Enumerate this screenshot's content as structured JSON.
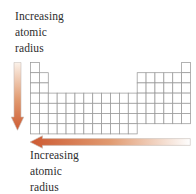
{
  "figure": {
    "background": "#ffffff",
    "labels": {
      "top": {
        "lines": [
          "Increasing",
          "atomic",
          "radius"
        ]
      },
      "bottom": {
        "lines": [
          "Increasing",
          "atomic",
          "radius"
        ]
      }
    },
    "colors": {
      "text": "#2d2d2d",
      "grid_line": "#999999",
      "cell_fill": "#ffffff",
      "arrow_dark": "#cd5a32",
      "arrow_mid": "#e19a70",
      "arrow_light_warm": "#fbf2ea",
      "arrow_light_end": "#fefefe",
      "arrow_outline": "#c6beb8"
    },
    "arrows": [
      {
        "name": "vertical-arrow",
        "direction": "down",
        "meaning": "atomic radius increases down a group"
      },
      {
        "name": "horizontal-arrow",
        "direction": "left",
        "meaning": "atomic radius increases right-to-left across a period"
      }
    ],
    "periodic_table": {
      "columns": 18,
      "rows": [
        {
          "row": 1,
          "segments": [
            {
              "start_col": 1,
              "span": 1
            },
            {
              "start_col": 18,
              "span": 1
            }
          ]
        },
        {
          "row": 2,
          "segments": [
            {
              "start_col": 1,
              "span": 2
            },
            {
              "start_col": 13,
              "span": 6
            }
          ]
        },
        {
          "row": 3,
          "segments": [
            {
              "start_col": 1,
              "span": 2
            },
            {
              "start_col": 13,
              "span": 6
            }
          ]
        },
        {
          "row": 4,
          "segments": [
            {
              "start_col": 1,
              "span": 18
            }
          ]
        },
        {
          "row": 5,
          "segments": [
            {
              "start_col": 1,
              "span": 18
            }
          ]
        },
        {
          "row": 6,
          "segments": [
            {
              "start_col": 1,
              "span": 18
            }
          ]
        },
        {
          "row": 7,
          "segments": [
            {
              "start_col": 1,
              "span": 12
            }
          ]
        }
      ]
    }
  }
}
